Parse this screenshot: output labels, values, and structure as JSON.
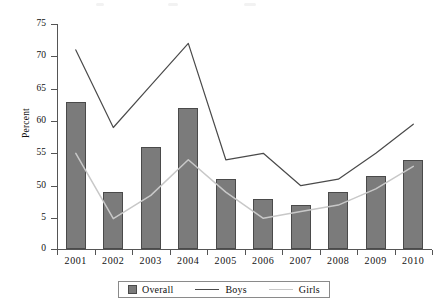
{
  "chart_data": {
    "type": "bar",
    "title": "",
    "subtitle": "",
    "xlabel": "",
    "ylabel": "Percent",
    "categories": [
      "2001",
      "2002",
      "2003",
      "2004",
      "2005",
      "2006",
      "2007",
      "2008",
      "2009",
      "2010"
    ],
    "y_tick_labels": [
      "75",
      "70",
      "65",
      "60",
      "55",
      "50",
      "5",
      "0"
    ],
    "y_tick_values": [
      75,
      70,
      65,
      60,
      55,
      50,
      45,
      0
    ],
    "ylim": [
      0,
      75
    ],
    "grid": false,
    "legend_position": "bottom",
    "series": [
      {
        "name": "Overall",
        "render": "bar",
        "color": "#7b7b7b",
        "values": [
          63,
          49,
          56,
          62,
          51,
          48,
          47,
          49,
          51.5,
          54
        ]
      },
      {
        "name": "Boys",
        "render": "line",
        "color": "#4a4a4a",
        "values": [
          71,
          59,
          65.5,
          72,
          54,
          55,
          50,
          51,
          55,
          59.5
        ]
      },
      {
        "name": "Girls",
        "render": "line",
        "color": "#c8c8c8",
        "values": [
          55,
          44,
          48.5,
          54,
          49,
          44.5,
          46,
          47,
          49.5,
          53
        ]
      }
    ]
  },
  "axis": {
    "y_title": "Percent"
  },
  "legend": {
    "items": [
      {
        "label": "Overall",
        "marker": "swatch",
        "color": "#7b7b7b"
      },
      {
        "label": "Boys",
        "marker": "line",
        "color": "#4a4a4a"
      },
      {
        "label": "Girls",
        "marker": "line",
        "color": "#c8c8c8"
      }
    ]
  },
  "colors": {
    "bar_fill": "#7b7b7b",
    "bar_stroke": "#4a4a4a",
    "boys_line": "#4a4a4a",
    "girls_line": "#c8c8c8",
    "axis": "#555555",
    "text": "#111111",
    "background": "#ffffff"
  }
}
